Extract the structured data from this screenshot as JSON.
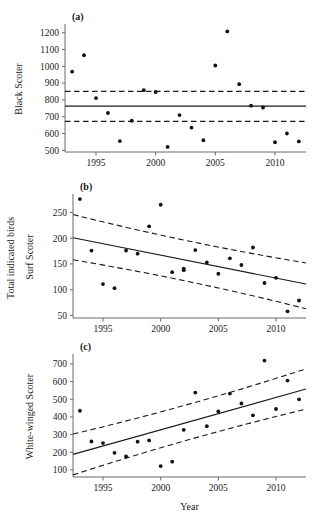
{
  "figure": {
    "shared_ylabel": "Total indicated birds",
    "xlabel": "Year",
    "xticks": [
      1995,
      2000,
      2005,
      2010
    ],
    "xlim": [
      1992.4,
      2012.6
    ]
  },
  "chart_data": [
    {
      "type": "scatter",
      "panel": "(a)",
      "title": "",
      "xlabel": "",
      "ylabel": "Black Scoter",
      "xlim": [
        1992.4,
        2012.6
      ],
      "ylim": [
        490,
        1240
      ],
      "yticks": [
        500,
        600,
        700,
        800,
        900,
        1000,
        1100,
        1200
      ],
      "xticks": [
        1995,
        2000,
        2005,
        2010
      ],
      "grid": false,
      "legend": "none",
      "x": [
        1993,
        1994,
        1995,
        1996,
        1997,
        1998,
        1999,
        2000,
        2001,
        2002,
        2003,
        2004,
        2005,
        2006,
        2007,
        2008,
        2009,
        2010,
        2011,
        2012
      ],
      "values": [
        968,
        1066,
        811,
        722,
        555,
        676,
        858,
        847,
        520,
        710,
        635,
        560,
        1005,
        1208,
        894,
        766,
        755,
        548,
        600,
        553
      ],
      "trend": {
        "name": "mean",
        "style": "solid",
        "y_start": 763,
        "y_end": 763
      },
      "confidence_bands": [
        {
          "name": "upper 95% CI",
          "style": "dashed",
          "y_start": 851,
          "y_end": 851
        },
        {
          "name": "lower 95% CI",
          "style": "dashed",
          "y_start": 672,
          "y_end": 672
        }
      ]
    },
    {
      "type": "scatter",
      "panel": "(b)",
      "title": "",
      "xlabel": "",
      "ylabel": "Surf Scoter",
      "xlim": [
        1992.4,
        2012.6
      ],
      "ylim": [
        45,
        282
      ],
      "yticks": [
        50,
        100,
        150,
        200,
        250
      ],
      "xticks": [
        1995,
        2000,
        2005,
        2010
      ],
      "grid": false,
      "legend": "none",
      "x": [
        1993,
        1994,
        1995,
        1996,
        1997,
        1998,
        1999,
        2000,
        2001,
        2002,
        2002,
        2003,
        2004,
        2005,
        2006,
        2007,
        2008,
        2009,
        2010,
        2011,
        2012
      ],
      "values": [
        276,
        176,
        111,
        103,
        176,
        170,
        223,
        265,
        134,
        138,
        141,
        177,
        153,
        131,
        161,
        148,
        182,
        113,
        123,
        58,
        79
      ],
      "trend": {
        "name": "regression",
        "style": "solid",
        "y_start": 201,
        "y_end": 111
      },
      "confidence_bands": [
        {
          "name": "upper 95% CI",
          "style": "dashed",
          "y_start": 246,
          "y_end": 152
        },
        {
          "name": "lower 95% CI",
          "style": "dashed",
          "y_start": 158,
          "y_end": 63
        }
      ]
    },
    {
      "type": "scatter",
      "panel": "(c)",
      "title": "",
      "xlabel": "Year",
      "ylabel": "White-winged Scoter",
      "xlim": [
        1992.4,
        2012.6
      ],
      "ylim": [
        60,
        745
      ],
      "yticks": [
        100,
        200,
        300,
        400,
        500,
        600,
        700
      ],
      "xticks": [
        1995,
        2000,
        2005,
        2010
      ],
      "grid": false,
      "legend": "none",
      "x": [
        1993,
        1994,
        1995,
        1996,
        1997,
        1998,
        1999,
        2000,
        2001,
        2002,
        2003,
        2004,
        2005,
        2006,
        2007,
        2008,
        2009,
        2010,
        2011,
        2012
      ],
      "values": [
        435,
        261,
        252,
        197,
        176,
        260,
        267,
        122,
        147,
        327,
        538,
        348,
        432,
        532,
        476,
        409,
        719,
        445,
        606,
        500
      ],
      "trend": {
        "name": "regression",
        "style": "solid",
        "y_start": 188,
        "y_end": 558
      },
      "confidence_bands": [
        {
          "name": "upper 95% CI",
          "style": "dashed",
          "y_start": 303,
          "y_end": 672
        },
        {
          "name": "lower 95% CI",
          "style": "dashed",
          "y_start": 72,
          "y_end": 444
        }
      ]
    }
  ]
}
